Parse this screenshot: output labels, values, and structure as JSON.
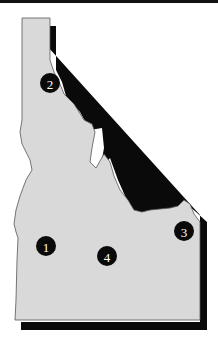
{
  "map": {
    "region": "Idaho",
    "fill_color": "#d9d9d9",
    "shadow_color": "#0a0a0a",
    "outline_color": "#555555",
    "markers": [
      {
        "label": "1",
        "x": 46,
        "y": 246
      },
      {
        "label": "2",
        "x": 50,
        "y": 83
      },
      {
        "label": "3",
        "x": 184,
        "y": 231
      },
      {
        "label": "4",
        "x": 107,
        "y": 256
      }
    ]
  }
}
